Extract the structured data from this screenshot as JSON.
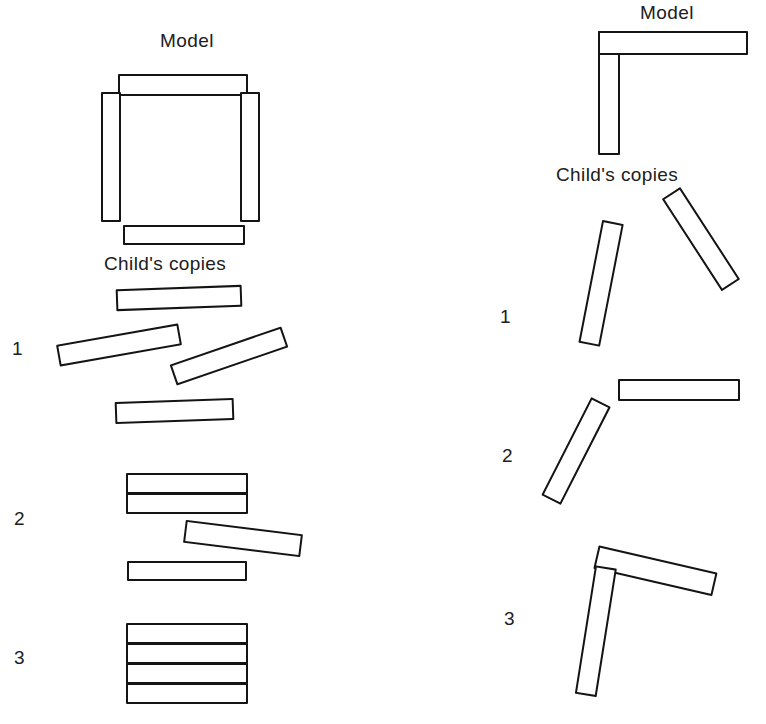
{
  "figure": {
    "background_color": "#ffffff",
    "ink_color": "#141414",
    "width": 766,
    "height": 724
  },
  "panels": [
    {
      "id": "left",
      "model_label": "Model",
      "copies_label": "Child's copies",
      "model_shape": "square",
      "model_sticks": [
        {
          "name": "model-top-bar",
          "x": 118,
          "y": 74,
          "w": 130,
          "h": 22,
          "rot": 0
        },
        {
          "name": "model-left-bar",
          "x": 101,
          "y": 92,
          "w": 20,
          "h": 130,
          "rot": 0
        },
        {
          "name": "model-right-bar",
          "x": 240,
          "y": 92,
          "w": 20,
          "h": 130,
          "rot": 0
        },
        {
          "name": "model-bottom-bar",
          "x": 123,
          "y": 225,
          "w": 122,
          "h": 20,
          "rot": 0
        }
      ],
      "rows": [
        {
          "number": "1",
          "number_x": 12,
          "number_y": 338,
          "sticks": [
            {
              "name": "copy-stick",
              "x": 116,
              "y": 287,
              "w": 126,
              "h": 22,
              "rot": -2
            },
            {
              "name": "copy-stick",
              "x": 57,
              "y": 334,
              "w": 124,
              "h": 22,
              "rot": -10
            },
            {
              "name": "copy-stick",
              "x": 170,
              "y": 345,
              "w": 118,
              "h": 22,
              "rot": -19
            },
            {
              "name": "copy-stick",
              "x": 115,
              "y": 400,
              "w": 119,
              "h": 22,
              "rot": -2
            }
          ]
        },
        {
          "number": "2",
          "number_x": 14,
          "number_y": 508,
          "sticks": [
            {
              "name": "copy-stick",
              "x": 126,
              "y": 473,
              "w": 122,
              "h": 21,
              "rot": 0
            },
            {
              "name": "copy-stick",
              "x": 126,
              "y": 493,
              "w": 122,
              "h": 21,
              "rot": 0
            },
            {
              "name": "copy-stick",
              "x": 184,
              "y": 527,
              "w": 118,
              "h": 23,
              "rot": 7
            },
            {
              "name": "copy-stick",
              "x": 127,
              "y": 561,
              "w": 120,
              "h": 20,
              "rot": 0
            }
          ]
        },
        {
          "number": "3",
          "number_x": 14,
          "number_y": 647,
          "sticks": [
            {
              "name": "copy-stick",
              "x": 126,
              "y": 623,
              "w": 122,
              "h": 21,
              "rot": 0
            },
            {
              "name": "copy-stick",
              "x": 126,
              "y": 643,
              "w": 122,
              "h": 21,
              "rot": 0
            },
            {
              "name": "copy-stick",
              "x": 126,
              "y": 663,
              "w": 122,
              "h": 21,
              "rot": 0
            },
            {
              "name": "copy-stick",
              "x": 126,
              "y": 683,
              "w": 122,
              "h": 21,
              "rot": 0
            }
          ]
        }
      ]
    },
    {
      "id": "right",
      "model_label": "Model",
      "copies_label": "Child's copies",
      "model_shape": "angle",
      "model_sticks": [
        {
          "name": "model-vertical-bar",
          "x": 118,
          "y": 31,
          "w": 22,
          "h": 124,
          "rot": 0
        },
        {
          "name": "model-horizontal-bar",
          "x": 118,
          "y": 31,
          "w": 150,
          "h": 24,
          "rot": 0
        }
      ],
      "rows": [
        {
          "number": "1",
          "number_x": 20,
          "number_y": 306,
          "sticks": [
            {
              "name": "copy-stick",
              "x": 122,
              "y": 222,
              "w": 22,
              "h": 125,
              "rot": 11
            },
            {
              "name": "copy-stick",
              "x": 180,
              "y": 193,
              "w": 22,
              "h": 110,
              "rot": -33
            }
          ]
        },
        {
          "number": "2",
          "number_x": 22,
          "number_y": 445,
          "sticks": [
            {
              "name": "copy-stick",
              "x": 138,
              "y": 379,
              "w": 122,
              "h": 22,
              "rot": 0
            },
            {
              "name": "copy-stick",
              "x": 110,
              "y": 402,
              "w": 22,
              "h": 110,
              "rot": 27
            }
          ]
        },
        {
          "number": "3",
          "number_x": 24,
          "number_y": 608,
          "sticks": [
            {
              "name": "copy-stick",
              "x": 116,
              "y": 545,
              "w": 122,
              "h": 24,
              "rot": 13
            },
            {
              "name": "copy-stick",
              "x": 115,
              "y": 567,
              "w": 22,
              "h": 130,
              "rot": 9
            }
          ]
        }
      ]
    }
  ],
  "captions": {
    "left_model": {
      "text": "Model",
      "x": 160,
      "y": 30
    },
    "left_copies": {
      "text": "Child's copies",
      "x": 104,
      "y": 253
    },
    "right_model": {
      "text": "Model",
      "x": 640,
      "y": 2
    },
    "right_copies": {
      "text": "Child's copies",
      "x": 556,
      "y": 164
    }
  }
}
